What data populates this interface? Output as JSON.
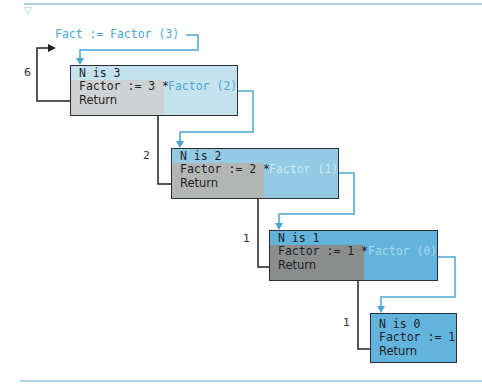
{
  "colors": {
    "connector": "#4aa6cf",
    "return_line": "#1e2226",
    "rule": "#8fc3d6",
    "box1_bg": "#c4e3ef",
    "box2_bg": "#93cbe4",
    "box3_bg": "#62b4dc",
    "box4_bg": "#62b4dc",
    "gray1": "#cfd2d2",
    "gray2": "#b3b5b5",
    "gray3": "#8b8d8d"
  },
  "header": {
    "marker": "▽"
  },
  "initial_call": {
    "lhs": "Fact :=",
    "call": "Factor (3)"
  },
  "activations": [
    {
      "n_line": "N is 3",
      "factor_line": "Factor := 3 *",
      "call": "Factor (2)",
      "return_line": "Return",
      "return_value": "6"
    },
    {
      "n_line": "N is 2",
      "factor_line": "Factor := 2 *",
      "call": "Factor (1)",
      "return_line": "Return",
      "return_value": "2"
    },
    {
      "n_line": "N is 1",
      "factor_line": "Factor := 1 *",
      "call": "Factor (0)",
      "return_line": "Return",
      "return_value": "1"
    },
    {
      "n_line": "N is 0",
      "factor_line": "Factor := 1",
      "call": "",
      "return_line": "Return",
      "return_value": "1"
    }
  ]
}
